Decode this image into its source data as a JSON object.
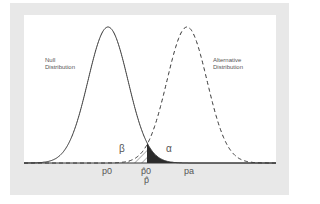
{
  "chart_data": {
    "type": "line",
    "title": "",
    "xlabel": "",
    "ylabel": "",
    "series": [
      {
        "name": "Null Distribution",
        "style": "solid",
        "mean_label": "p0"
      },
      {
        "name": "Alternative Distribution",
        "style": "dashed",
        "mean_label": "pa"
      }
    ],
    "annotations": [
      {
        "text": "β",
        "meaning": "hatched area under alternative left of critical value"
      },
      {
        "text": "α",
        "meaning": "solid dark area under null right of critical value"
      }
    ],
    "x_ticks": [
      "p0",
      "p̂0",
      "p̂"
    ],
    "x_tick_labels": {
      "p0": "p0",
      "crit": "p̂0",
      "crit_sub": "p̂",
      "pa": "pa"
    },
    "grid": false
  },
  "labels": {
    "null_line1": "Null",
    "null_line2": "Distribution",
    "alt_line1": "Alternative",
    "alt_line2": "Distribution",
    "beta": "β",
    "alpha": "α",
    "tick_p0": "p0",
    "tick_crit": "p̂0",
    "tick_phat": "p̂",
    "tick_pa": "pa"
  }
}
